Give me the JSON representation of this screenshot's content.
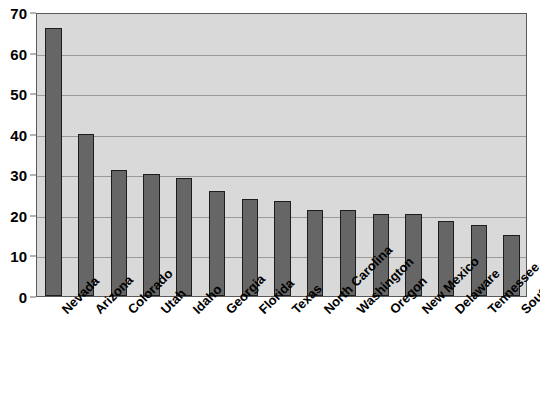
{
  "chart_data": {
    "type": "bar",
    "title": "",
    "xlabel": "",
    "ylabel": "",
    "ylim": [
      0,
      70
    ],
    "yticks": [
      0,
      10,
      20,
      30,
      40,
      50,
      60,
      70
    ],
    "grid": true,
    "legend": false,
    "bar_color": "#666666",
    "bar_edge_color": "#1d1d1d",
    "plot_background": "#d9d9d9",
    "categories": [
      "Nevada",
      "Arizona",
      "Colorado",
      "Utah",
      "Idaho",
      "Georgia",
      "Florida",
      "Texas",
      "North Carolina",
      "Washington",
      "Oregon",
      "New Mexico",
      "Delaware",
      "Tennessee",
      "South Carolina"
    ],
    "values": [
      66,
      40,
      31,
      30,
      29,
      26,
      24,
      23.3,
      21.2,
      21.2,
      20.3,
      20.3,
      18.4,
      17.4,
      15.1
    ]
  },
  "axes": {
    "y_tick_labels": [
      "70",
      "60",
      "50",
      "40",
      "30",
      "20",
      "10",
      "0"
    ]
  }
}
